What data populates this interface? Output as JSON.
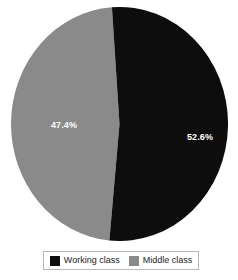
{
  "chart_data": {
    "type": "pie",
    "title": "",
    "subtitle": "",
    "categories": [
      "Working class",
      "Middle class"
    ],
    "values": [
      52.6,
      47.4
    ],
    "unit": "%",
    "data_labels": [
      "52.6%",
      "47.4%"
    ],
    "series": [
      {
        "name": "Working class",
        "value": 52.6,
        "label": "52.6%",
        "color": "#0d0d0d"
      },
      {
        "name": "Middle class",
        "value": 47.4,
        "label": "47.4%",
        "color": "#8a8a8a"
      }
    ],
    "legend_position": "bottom",
    "grid": false,
    "start_angle_deg": -4,
    "background": "#ffffff"
  },
  "pie": {
    "slices": [
      {
        "name": "Working class",
        "label": "52.6%",
        "color": "#0d0d0d"
      },
      {
        "name": "Middle class",
        "label": "47.4%",
        "color": "#8a8a8a"
      }
    ]
  },
  "legend": {
    "items": [
      {
        "label": "Working class",
        "color": "#0d0d0d"
      },
      {
        "label": "Middle class",
        "color": "#8a8a8a"
      }
    ]
  }
}
